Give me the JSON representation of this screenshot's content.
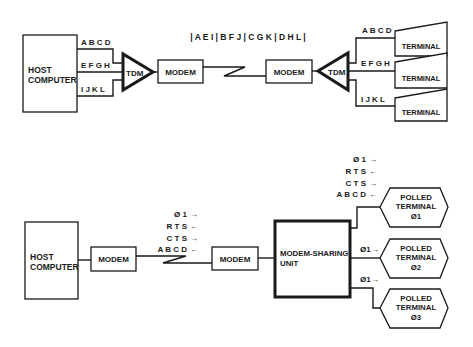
{
  "diagram": {
    "top": {
      "host": {
        "line1": "HOST",
        "line2": "COMPUTER"
      },
      "channels_left": [
        "A B C D",
        "E F G H",
        "I J K L"
      ],
      "tdm_left": "TDM",
      "modem_left": "MODEM",
      "frame_label": "| A E I | B F J | C G K | D H L |",
      "modem_right": "MODEM",
      "tdm_right": "TDM",
      "channels_right": [
        "A B C D",
        "E F G H",
        "I J K L"
      ],
      "terminals": [
        "TERMINAL",
        "TERMINAL",
        "TERMINAL"
      ]
    },
    "bottom": {
      "host": {
        "line1": "HOST",
        "line2": "COMPUTER"
      },
      "modem_left": "MODEM",
      "signals_left": [
        {
          "label": "Ø 1",
          "arrow": "→"
        },
        {
          "label": "R T S",
          "arrow": "←"
        },
        {
          "label": "C T S",
          "arrow": "→"
        },
        {
          "label": "A B C D",
          "arrow": "←"
        }
      ],
      "modem_right": "MODEM",
      "msu": {
        "line1": "MODEM-SHARING",
        "line2": "UNIT"
      },
      "signals_right": [
        {
          "label": "Ø 1",
          "arrow": "→"
        },
        {
          "label": "R T S",
          "arrow": "←"
        },
        {
          "label": "C T S",
          "arrow": "→"
        },
        {
          "label": "A B C D",
          "arrow": "←"
        }
      ],
      "pt2_signal": {
        "label": "Ø1",
        "arrow": "→"
      },
      "pt3_signal": {
        "label": "Ø1",
        "arrow": "→"
      },
      "polled_terminals": [
        {
          "l1": "POLLED",
          "l2": "TERMINAL",
          "l3": "Ø1"
        },
        {
          "l1": "POLLED",
          "l2": "TERMINAL",
          "l3": "Ø2"
        },
        {
          "l1": "POLLED",
          "l2": "TERMINAL",
          "l3": "Ø3"
        }
      ]
    }
  }
}
